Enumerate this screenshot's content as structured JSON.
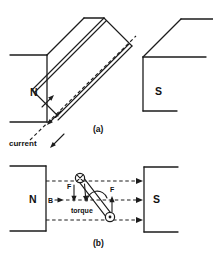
{
  "figure": {
    "colors": {
      "line": "#1c1c1c",
      "background": "#ffffff"
    },
    "panel_a": {
      "label": "(a)",
      "north_pole": "N",
      "south_pole": "S",
      "current_label": "current"
    },
    "panel_b": {
      "label": "(b)",
      "north_pole": "N",
      "south_pole": "S",
      "field_label": "B",
      "force_label_left": "F",
      "force_label_right": "F",
      "torque_label": "torque"
    }
  }
}
